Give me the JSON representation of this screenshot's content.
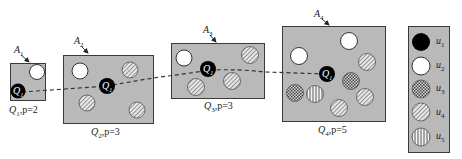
{
  "diagram": {
    "title": "",
    "regions": [
      {
        "id": "A1",
        "label": "A",
        "sub": "1",
        "caption_q": "Q",
        "caption_sub": "1",
        "caption_rest": ",p=2",
        "p": 2
      },
      {
        "id": "A2",
        "label": "A",
        "sub": "2",
        "caption_q": "Q",
        "caption_sub": "2",
        "caption_rest": ",p=3",
        "p": 3
      },
      {
        "id": "A3",
        "label": "A",
        "sub": "3",
        "caption_q": "Q",
        "caption_sub": "3",
        "caption_rest": ",p=3",
        "p": 3
      },
      {
        "id": "A4",
        "label": "A",
        "sub": "4",
        "caption_q": "Q",
        "caption_sub": "4",
        "caption_rest": ",p=5",
        "p": 5
      }
    ],
    "query_point": {
      "label": "Q",
      "sub": "1"
    },
    "legend": [
      {
        "label": "u",
        "sub": "1",
        "pattern": "solid-black"
      },
      {
        "label": "u",
        "sub": "2",
        "pattern": "white"
      },
      {
        "label": "u",
        "sub": "3",
        "pattern": "crosshatch"
      },
      {
        "label": "u",
        "sub": "4",
        "pattern": "diagonal"
      },
      {
        "label": "u",
        "sub": "5",
        "pattern": "vertical"
      }
    ],
    "colors": {
      "region_fill": "#b9b9b9",
      "border": "#3a3a3a",
      "query": "#000000",
      "path": "#333333"
    }
  }
}
